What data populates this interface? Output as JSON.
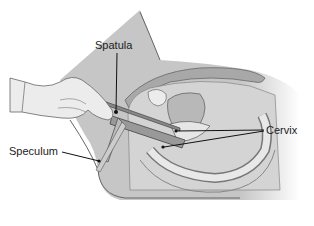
{
  "diagram": {
    "labels": [
      {
        "id": "spatula",
        "text": "Spatula"
      },
      {
        "id": "speculum",
        "text": "Speculum"
      },
      {
        "id": "cervix",
        "text": "Cervix"
      }
    ]
  },
  "colors": {
    "background": "#ffffff",
    "body_gray": "#c8c8c8",
    "tissue_light": "#dedede",
    "tissue_mid": "#b4b4b4",
    "outline": "#555555",
    "leader": "#111111"
  }
}
